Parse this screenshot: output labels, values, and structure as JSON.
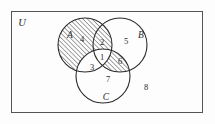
{
  "figure": {
    "kind": "venn-diagram",
    "universe_label": "U",
    "set_labels": [
      "A",
      "B",
      "C"
    ],
    "region_numbers": [
      "1",
      "2",
      "3",
      "4",
      "5",
      "6",
      "7",
      "8"
    ],
    "colors": {
      "stroke": "#2b2b2b",
      "background": "#fdfdfd",
      "hatch": "#2b2b2b",
      "frame": "#555555"
    }
  },
  "universe": {
    "label": "U",
    "frame": {
      "x": 11,
      "y": 11,
      "width": 192,
      "height": 102
    },
    "label_pos": {
      "x": 22,
      "y": 25
    }
  },
  "sets": [
    {
      "name": "A",
      "label": "A",
      "cx": 85,
      "cy": 45,
      "r": 27,
      "label_pos": {
        "x": 70,
        "y": 37
      }
    },
    {
      "name": "B",
      "label": "B",
      "cx": 120,
      "cy": 45,
      "r": 27,
      "label_pos": {
        "x": 141,
        "y": 37
      }
    },
    {
      "name": "C",
      "label": "C",
      "cx": 103,
      "cy": 76,
      "r": 27,
      "label_pos": {
        "x": 105,
        "y": 99
      }
    }
  ],
  "regions": [
    {
      "id": "1",
      "label": "1",
      "description": "A and B and C",
      "x": 102,
      "y": 58,
      "shaded": false
    },
    {
      "id": "2",
      "label": "2",
      "description": "A and B, not C",
      "x": 102,
      "y": 43,
      "shaded": true
    },
    {
      "id": "3",
      "label": "3",
      "description": "A and C, not B",
      "x": 92,
      "y": 68,
      "shaded": false
    },
    {
      "id": "4",
      "label": "4",
      "description": "A only",
      "x": 81,
      "y": 40,
      "shaded": true
    },
    {
      "id": "5",
      "label": "5",
      "description": "B only",
      "x": 126,
      "y": 42,
      "shaded": false
    },
    {
      "id": "6",
      "label": "6",
      "description": "B and C, not A",
      "x": 120,
      "y": 62,
      "shaded": true
    },
    {
      "id": "7",
      "label": "7",
      "description": "C only",
      "x": 108,
      "y": 80,
      "shaded": false
    },
    {
      "id": "8",
      "label": "8",
      "description": "outside A, B and C",
      "x": 146,
      "y": 88,
      "shaded": false
    }
  ],
  "shading": {
    "pattern": "diagonal-hatch",
    "direction": "bottom-left-to-top-right",
    "shaded_region_ids": [
      "2",
      "4",
      "6"
    ],
    "expression": "(A ∪ (B ∩ C)) − (A ∩ C)"
  }
}
